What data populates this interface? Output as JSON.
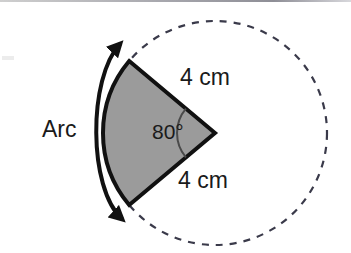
{
  "figure": {
    "background_color": "#ffffff",
    "width": 351,
    "height": 253,
    "labels": {
      "arc": "Arc",
      "angle": "80°",
      "radius_top": "4 cm",
      "radius_bottom": "4 cm"
    },
    "colors": {
      "sector_fill": "#9b9b9b",
      "sector_stroke": "#111111",
      "dashed_circle": "#3a3a4a",
      "arrow": "#111111",
      "text": "#1a1a1a",
      "top_rule": "#a8a8ae"
    },
    "geometry": {
      "circle_center_x": 215,
      "circle_center_y": 133,
      "circle_radius": 112,
      "sector_angle_degrees": 80,
      "sector_start_angle_degrees": 140,
      "sector_end_angle_degrees": 220,
      "angle_mark_radius": 38,
      "radius_length_label": "4 cm"
    },
    "elements": {
      "dashed_circle_name": "dashed-circle",
      "sector_name": "shaded-sector",
      "arc_arrow_name": "arc-double-arrow",
      "angle_mark_name": "angle-arc-mark"
    }
  }
}
